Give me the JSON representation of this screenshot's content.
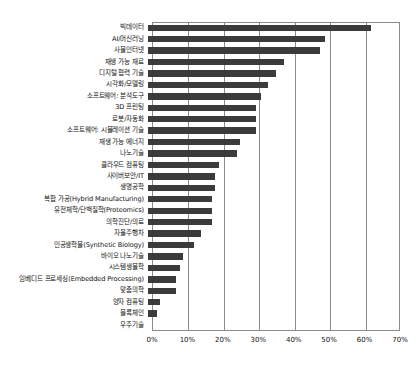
{
  "chart_data": {
    "type": "bar",
    "orientation": "horizontal",
    "title": "",
    "subtitle": "",
    "xlabel": "",
    "ylabel": "",
    "xlim": [
      0,
      70
    ],
    "xtick_labels": [
      "0%",
      "10%",
      "20%",
      "30%",
      "40%",
      "50%",
      "60%",
      "70%"
    ],
    "xtick_values": [
      0,
      10,
      20,
      30,
      40,
      50,
      60,
      70
    ],
    "grid": true,
    "legend": false,
    "value_suffix": "%",
    "bar_color": "#3b3b3b",
    "axis_color": "#8a8a8a",
    "categories": [
      "빅데이터",
      "AI/머신러닝",
      "사물인터넷",
      "재생 가능 재료",
      "디지털 협력 기술",
      "시각화/모델링",
      "소프트웨어: 분석도구",
      "3D 프린팅",
      "로봇/자동화",
      "소프트웨어: 시뮬레이션 기술",
      "재생 가능 에너지",
      "나노기술",
      "클라우드 컴퓨팅",
      "사이버보안/IT",
      "생명공학",
      "복합 가공(Hybrid Manufacturing)",
      "유전체학/단백질학(Proteomics)",
      "의학진단/의료",
      "자율주행차",
      "인공생학물(Synthetic Biology)",
      "바이오 나노기술",
      "시스템생물학",
      "임베디드 프로세싱(Embedded Processing)",
      "맞춤의학",
      "양자 컴퓨팅",
      "블록체인",
      "우주기술"
    ],
    "values": [
      63.0,
      50.0,
      48.5,
      38.5,
      36.0,
      34.0,
      32.0,
      30.5,
      30.5,
      30.5,
      26.0,
      25.0,
      20.0,
      19.0,
      19.0,
      18.0,
      18.0,
      18.0,
      15.0,
      13.0,
      10.0,
      9.0,
      8.0,
      8.0,
      3.5,
      2.5,
      0.0
    ]
  }
}
